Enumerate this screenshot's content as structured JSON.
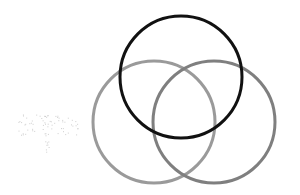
{
  "diagram": {
    "type": "venn",
    "background": "#ffffff",
    "circles": [
      {
        "id": "top",
        "cx": 181,
        "cy": 77,
        "r": 61,
        "stroke": "#111111",
        "stroke_width": 3
      },
      {
        "id": "left",
        "cx": 154,
        "cy": 122,
        "r": 61,
        "stroke": "#9a9a9a",
        "stroke_width": 3
      },
      {
        "id": "right",
        "cx": 214,
        "cy": 122,
        "r": 61,
        "stroke": "#7f7f7f",
        "stroke_width": 3
      }
    ],
    "smudge": {
      "cx": 48,
      "cy": 125,
      "color": "#cfcfcf"
    }
  }
}
